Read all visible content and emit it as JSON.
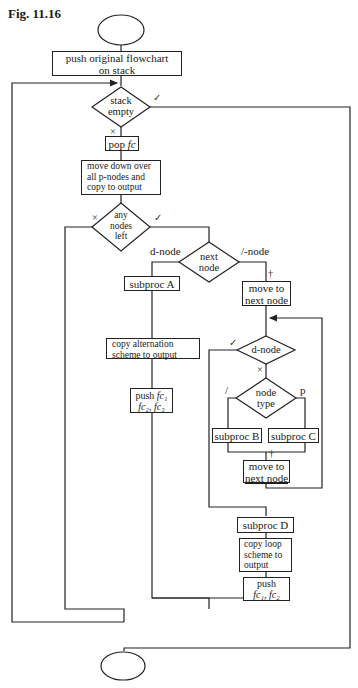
{
  "figure": {
    "title": "Fig. 11.16"
  },
  "nodes": {
    "start": {
      "shape": "terminal-ellipse",
      "label": ""
    },
    "push_original": {
      "label_line1": "push original flowchart",
      "label_line2": "on stack"
    },
    "stack_empty": {
      "shape": "decision",
      "label_line1": "stack",
      "label_line2": "empty",
      "yes_mark": "✓",
      "no_mark": "×"
    },
    "pop_fc": {
      "label_prefix": "pop",
      "label_var": "fc"
    },
    "move_down": {
      "label_line1": "move down over",
      "label_line2": "all p-nodes and",
      "label_line3": "copy to output"
    },
    "any_nodes_left": {
      "shape": "decision",
      "label_line1": "any",
      "label_line2": "nodes",
      "label_line3": "left",
      "no_mark": "×",
      "yes_mark": "✓"
    },
    "next_node": {
      "shape": "decision",
      "label_line1": "next",
      "label_line2": "node",
      "left_branch": "d-node",
      "right_branch": "/-node"
    },
    "subproc_a": {
      "label": "subproc A"
    },
    "copy_alternation": {
      "label_line1": "copy alternation",
      "label_line2": "scheme to output"
    },
    "push_fc123": {
      "label_prefix": "push",
      "line1_var": "fc₁",
      "line2_var": "fc₂, fc₃"
    },
    "move_next_1": {
      "label_line1": "move to",
      "label_line2": "next node",
      "dagger": "†"
    },
    "d_node": {
      "shape": "decision",
      "label": "d-node",
      "yes_mark": "✓",
      "no_mark": "×"
    },
    "node_type": {
      "shape": "decision",
      "label_line1": "node",
      "label_line2": "type",
      "left_branch": "/",
      "right_branch": "p"
    },
    "subproc_b": {
      "label": "subproc B"
    },
    "subproc_c": {
      "label": "subproc C"
    },
    "move_next_2": {
      "label_line1": "move to",
      "label_line2": "next node",
      "dagger": "†"
    },
    "subproc_d": {
      "label": "subproc D"
    },
    "copy_loop": {
      "label_line1": "copy loop",
      "label_line2": "scheme to",
      "label_line3": "output"
    },
    "push_fc12": {
      "label_prefix": "push",
      "line2_var": "fc₁, fc₂"
    },
    "end": {
      "shape": "terminal-ellipse",
      "label": ""
    }
  },
  "colors": {
    "line": "#222222",
    "background": "#ffffff"
  }
}
